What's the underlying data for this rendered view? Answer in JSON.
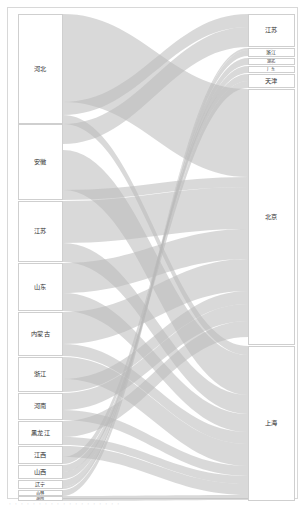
{
  "figure": {
    "type": "sankey",
    "background": "#ffffff",
    "frame_color": "#d8d8d8",
    "node_fill": "#ffffff",
    "node_stroke": "#cfcfcf",
    "link_color": "#b9b9b9",
    "link_opacity": 0.55,
    "width": 306,
    "height": 507
  },
  "caption": {
    "text": "· · · · · · · · · · · · · · · · · · ·"
  },
  "chart_data": {
    "type": "sankey",
    "title": "",
    "xlabel": "",
    "ylabel": "",
    "source_nodes": [
      {
        "id": "s_hebei",
        "label": "河北",
        "y0": 14,
        "y1": 124,
        "value": 110
      },
      {
        "id": "s_anhui",
        "label": "安徽",
        "y0": 124,
        "y1": 200,
        "value": 76
      },
      {
        "id": "s_jiangsu",
        "label": "江苏",
        "y0": 201,
        "y1": 262,
        "value": 61
      },
      {
        "id": "s_shandong",
        "label": "山东",
        "y0": 263,
        "y1": 311,
        "value": 48
      },
      {
        "id": "s_neimenggu",
        "label": "内蒙古",
        "y0": 312,
        "y1": 356,
        "value": 44
      },
      {
        "id": "s_zhejiang",
        "label": "浙江",
        "y0": 357,
        "y1": 392,
        "value": 35
      },
      {
        "id": "s_henan",
        "label": "河南",
        "y0": 393,
        "y1": 420,
        "value": 27
      },
      {
        "id": "s_heilongjiang",
        "label": "黑龙江",
        "y0": 421,
        "y1": 445,
        "value": 24
      },
      {
        "id": "s_jiangxi",
        "label": "江西",
        "y0": 446,
        "y1": 464,
        "value": 18
      },
      {
        "id": "s_shanxi",
        "label": "山西",
        "y0": 465,
        "y1": 479,
        "value": 14
      },
      {
        "id": "s_liaoning",
        "label": "辽宁",
        "y0": 480,
        "y1": 489,
        "value": 9
      },
      {
        "id": "s_jilin",
        "label": "吉林",
        "y0": 490,
        "y1": 496,
        "value": 6
      },
      {
        "id": "s_hunan",
        "label": "湖南",
        "y0": 496,
        "y1": 501,
        "value": 5
      }
    ],
    "target_nodes": [
      {
        "id": "t_jiangsu",
        "label": "江苏",
        "y0": 14,
        "y1": 47,
        "value": 33
      },
      {
        "id": "t_zhejiang",
        "label": "浙江",
        "y0": 48,
        "y1": 57,
        "value": 9
      },
      {
        "id": "t_hubei",
        "label": "湖北",
        "y0": 58,
        "y1": 65,
        "value": 7
      },
      {
        "id": "t_guangdong",
        "label": "广东",
        "y0": 66,
        "y1": 73,
        "value": 7
      },
      {
        "id": "t_tianjin",
        "label": "天津",
        "y0": 74,
        "y1": 88,
        "value": 14
      },
      {
        "id": "t_beijing",
        "label": "北京",
        "y0": 89,
        "y1": 345,
        "value": 256
      },
      {
        "id": "t_shanghai",
        "label": "上海",
        "y0": 346,
        "y1": 501,
        "value": 155
      }
    ],
    "links": [
      {
        "source": "s_hebei",
        "target": "t_beijing",
        "value": 88,
        "sy0": 14,
        "sy1": 102,
        "ty0": 89,
        "ty1": 177
      },
      {
        "source": "s_hebei",
        "target": "t_jiangsu",
        "value": 13,
        "sy0": 102,
        "sy1": 115,
        "ty0": 14,
        "ty1": 27
      },
      {
        "source": "s_hebei",
        "target": "t_shanghai",
        "value": 9,
        "sy0": 115,
        "sy1": 124,
        "ty0": 346,
        "ty1": 355
      },
      {
        "source": "s_anhui",
        "target": "t_jiangsu",
        "value": 20,
        "sy0": 124,
        "sy1": 144,
        "ty0": 27,
        "ty1": 47
      },
      {
        "source": "s_anhui",
        "target": "t_shanghai",
        "value": 40,
        "sy0": 150,
        "sy1": 190,
        "ty0": 355,
        "ty1": 395
      },
      {
        "source": "s_anhui",
        "target": "t_beijing",
        "value": 10,
        "sy0": 190,
        "sy1": 200,
        "ty0": 177,
        "ty1": 187
      },
      {
        "source": "s_jiangsu",
        "target": "t_beijing",
        "value": 42,
        "sy0": 201,
        "sy1": 243,
        "ty0": 187,
        "ty1": 229
      },
      {
        "source": "s_jiangsu",
        "target": "t_shanghai",
        "value": 19,
        "sy0": 243,
        "sy1": 262,
        "ty0": 395,
        "ty1": 414
      },
      {
        "source": "s_shandong",
        "target": "t_beijing",
        "value": 30,
        "sy0": 263,
        "sy1": 293,
        "ty0": 229,
        "ty1": 259
      },
      {
        "source": "s_shandong",
        "target": "t_shanghai",
        "value": 18,
        "sy0": 293,
        "sy1": 311,
        "ty0": 414,
        "ty1": 432
      },
      {
        "source": "s_neimenggu",
        "target": "t_beijing",
        "value": 32,
        "sy0": 312,
        "sy1": 344,
        "ty0": 259,
        "ty1": 291
      },
      {
        "source": "s_neimenggu",
        "target": "t_shanghai",
        "value": 12,
        "sy0": 344,
        "sy1": 356,
        "ty0": 432,
        "ty1": 444
      },
      {
        "source": "s_zhejiang",
        "target": "t_shanghai",
        "value": 22,
        "sy0": 357,
        "sy1": 379,
        "ty0": 444,
        "ty1": 466
      },
      {
        "source": "s_zhejiang",
        "target": "t_beijing",
        "value": 13,
        "sy0": 379,
        "sy1": 392,
        "ty0": 291,
        "ty1": 304
      },
      {
        "source": "s_henan",
        "target": "t_beijing",
        "value": 17,
        "sy0": 393,
        "sy1": 410,
        "ty0": 304,
        "ty1": 321
      },
      {
        "source": "s_henan",
        "target": "t_shanghai",
        "value": 10,
        "sy0": 410,
        "sy1": 420,
        "ty0": 466,
        "ty1": 476
      },
      {
        "source": "s_heilongjiang",
        "target": "t_beijing",
        "value": 16,
        "sy0": 421,
        "sy1": 437,
        "ty0": 321,
        "ty1": 337
      },
      {
        "source": "s_heilongjiang",
        "target": "t_shanghai",
        "value": 8,
        "sy0": 437,
        "sy1": 445,
        "ty0": 476,
        "ty1": 484
      },
      {
        "source": "s_jiangxi",
        "target": "t_shanghai",
        "value": 11,
        "sy0": 446,
        "sy1": 457,
        "ty0": 484,
        "ty1": 495
      },
      {
        "source": "s_jiangxi",
        "target": "t_tianjin",
        "value": 7,
        "sy0": 457,
        "sy1": 464,
        "ty0": 74,
        "ty1": 81
      },
      {
        "source": "s_shanxi",
        "target": "t_tianjin",
        "value": 7,
        "sy0": 465,
        "sy1": 472,
        "ty0": 81,
        "ty1": 88
      },
      {
        "source": "s_shanxi",
        "target": "t_guangdong",
        "value": 7,
        "sy0": 472,
        "sy1": 479,
        "ty0": 66,
        "ty1": 73
      },
      {
        "source": "s_liaoning",
        "target": "t_hubei",
        "value": 7,
        "sy0": 480,
        "sy1": 487,
        "ty0": 58,
        "ty1": 65
      },
      {
        "source": "s_liaoning",
        "target": "t_zhejiang",
        "value": 2,
        "sy0": 487,
        "sy1": 489,
        "ty0": 48,
        "ty1": 50
      },
      {
        "source": "s_jilin",
        "target": "t_zhejiang",
        "value": 6,
        "sy0": 490,
        "sy1": 496,
        "ty0": 50,
        "ty1": 56
      },
      {
        "source": "s_hunan",
        "target": "t_shanghai",
        "value": 5,
        "sy0": 496,
        "sy1": 501,
        "ty0": 495,
        "ty1": 500
      }
    ],
    "layout": {
      "source_x0": 18,
      "source_x1": 63,
      "target_x0": 248,
      "target_x1": 295,
      "legend": "none",
      "grid": false
    }
  }
}
